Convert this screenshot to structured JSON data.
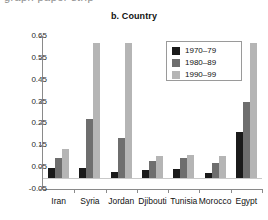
{
  "figure": {
    "clipped_top_text": "graph paper strip",
    "title": "b. Country"
  },
  "chart_data": {
    "type": "bar",
    "title": "b. Country",
    "xlabel": "",
    "ylabel": "",
    "categories": [
      "Iran",
      "Syria",
      "Jordan",
      "Djibouti",
      "Tunisia",
      "Morocco",
      "Egypt"
    ],
    "series": [
      {
        "name": "1970–79",
        "color": "#1a1a1a",
        "values": [
          0.048,
          0.045,
          0.03,
          0.035,
          0.04,
          0.025,
          0.21
        ]
      },
      {
        "name": "1980–89",
        "color": "#6e6e6e",
        "values": [
          0.09,
          0.27,
          0.185,
          0.08,
          0.09,
          0.07,
          0.35
        ]
      },
      {
        "name": "1990–99",
        "color": "#b5b5b5",
        "values": [
          0.135,
          0.62,
          0.62,
          0.1,
          0.105,
          0.1,
          0.62
        ]
      }
    ],
    "ylim": [
      -0.05,
      0.65
    ],
    "ytick_labels": [
      "0.65",
      "0.55",
      "0.45",
      "0.35",
      "0.25",
      "0.15",
      "0.05",
      "-0.05"
    ],
    "ytick_values": [
      0.65,
      0.55,
      0.45,
      0.35,
      0.25,
      0.15,
      0.05,
      -0.05
    ],
    "grid": false,
    "legend_position": "upper-right",
    "legend_entries": [
      "1970–79",
      "1980–89",
      "1990–99"
    ]
  }
}
